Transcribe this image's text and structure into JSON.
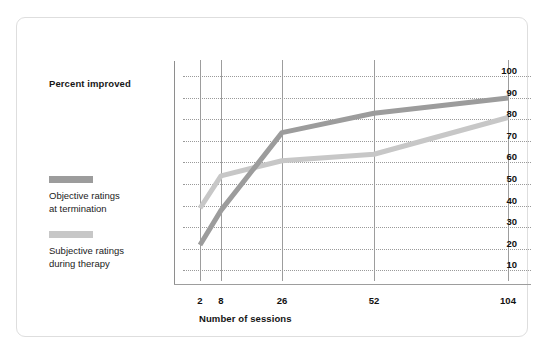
{
  "chart_data": {
    "type": "line",
    "title": "",
    "xlabel": "Number of sessions",
    "ylabel": "Percent improved",
    "categories": [
      "2",
      "8",
      "26",
      "52",
      "104"
    ],
    "x_positions": [
      2,
      8,
      26,
      52,
      104
    ],
    "ylim": [
      0,
      100
    ],
    "yticks": [
      100,
      90,
      80,
      70,
      60,
      50,
      40,
      30,
      20,
      10
    ],
    "grid": "horizontal dotted gridlines at each y tick; solid vertical gridlines at each x category",
    "legend_position": "left",
    "series": [
      {
        "name": "Objective ratings\nat termination",
        "color": "#9c9c9c",
        "values": [
          19,
          35,
          71,
          80,
          87
        ]
      },
      {
        "name": "Subjective ratings\nduring therapy",
        "color": "#c7c7c7",
        "values": [
          36,
          51,
          58,
          61,
          78
        ]
      }
    ]
  },
  "legend": {
    "axis_title_y": "Percent improved",
    "entries": [
      {
        "label": "Objective ratings\nat termination",
        "color": "#9c9c9c"
      },
      {
        "label": "Subjective ratings\nduring therapy",
        "color": "#c7c7c7"
      }
    ]
  },
  "axis": {
    "x_title": "Number of sessions",
    "y_ticks": [
      "100",
      "90",
      "80",
      "70",
      "60",
      "50",
      "40",
      "30",
      "20",
      "10"
    ],
    "x_ticks": [
      "2",
      "8",
      "26",
      "52",
      "104"
    ]
  },
  "colors": {
    "card_border": "#dedede",
    "background": "#ffffff",
    "gridline": "#9a9a9a",
    "axis": "#9d9d9d",
    "text": "#111111",
    "series_dark": "#9c9c9c",
    "series_light": "#c7c7c7"
  }
}
